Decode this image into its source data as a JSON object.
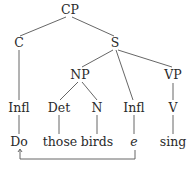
{
  "tree": {
    "root": "CP",
    "nodes": {
      "cp": {
        "label": "CP"
      },
      "c": {
        "label": "C"
      },
      "s": {
        "label": "S"
      },
      "np": {
        "label": "NP"
      },
      "vp": {
        "label": "VP"
      },
      "infl_left": {
        "label": "Infl"
      },
      "det": {
        "label": "Det"
      },
      "n": {
        "label": "N"
      },
      "infl_right": {
        "label": "Infl"
      },
      "v": {
        "label": "V"
      }
    },
    "words": {
      "do": {
        "label": "Do"
      },
      "those": {
        "label": "those"
      },
      "birds": {
        "label": "birds"
      },
      "trace": {
        "label": "e"
      },
      "sing": {
        "label": "sing"
      }
    },
    "movement_arrow": {
      "from": "e",
      "to": "Do"
    }
  },
  "colors": {
    "line": "#555555",
    "text": "#2a2a2a"
  }
}
